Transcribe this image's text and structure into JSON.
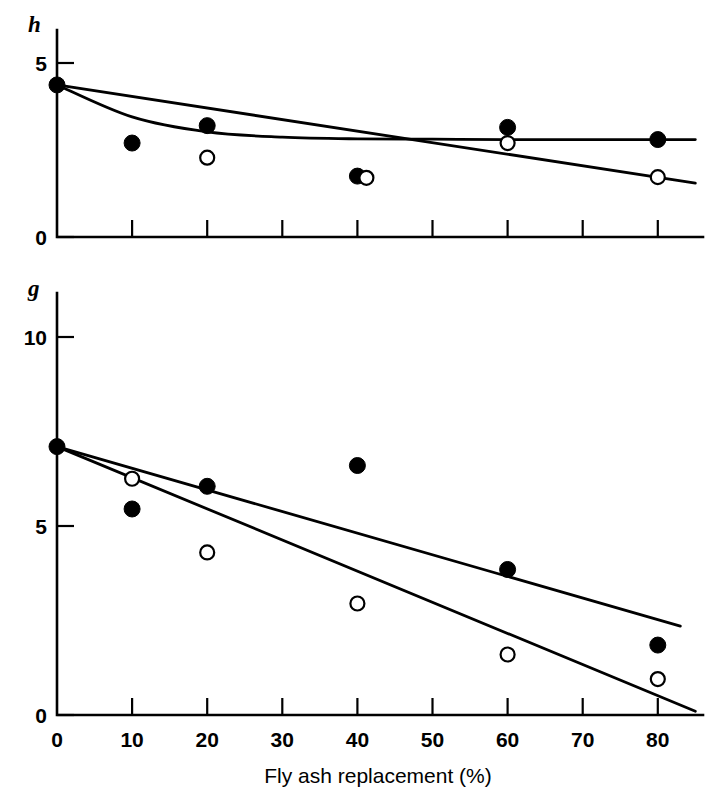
{
  "figure": {
    "background": "#ffffff",
    "ink": "#000000",
    "width": 725,
    "height": 802
  },
  "chart_data": [
    {
      "type": "scatter",
      "panel": "top",
      "title": "",
      "ylabel": "h",
      "xlabel": "",
      "xlim": [
        0,
        86
      ],
      "ylim": [
        0,
        5.6
      ],
      "xticks": [
        0,
        10,
        20,
        30,
        40,
        50,
        60,
        70,
        80
      ],
      "xticklabels": [
        "",
        "",
        "",
        "",
        "",
        "",
        "",
        "",
        ""
      ],
      "yticks": [
        0,
        5
      ],
      "yticklabels": [
        "0",
        "5"
      ],
      "grid": false,
      "legend": "none",
      "series": [
        {
          "name": "filled",
          "marker": "filled-circle",
          "x": [
            0,
            10,
            20,
            40,
            60,
            80
          ],
          "values": [
            4.37,
            2.7,
            3.2,
            1.75,
            3.15,
            2.8
          ]
        },
        {
          "name": "open",
          "marker": "open-circle",
          "x": [
            20,
            40,
            60,
            80
          ],
          "values": [
            2.28,
            1.7,
            2.7,
            1.72
          ]
        }
      ],
      "fits": [
        {
          "name": "filled-fit",
          "style": "curve",
          "x": [
            0,
            10,
            20,
            30,
            40,
            50,
            60,
            70,
            80,
            85
          ],
          "values": [
            4.37,
            3.45,
            3.02,
            2.87,
            2.82,
            2.81,
            2.8,
            2.8,
            2.8,
            2.8
          ]
        },
        {
          "name": "open-fit",
          "style": "line",
          "x": [
            0,
            85
          ],
          "values": [
            4.37,
            1.55
          ]
        }
      ]
    },
    {
      "type": "scatter",
      "panel": "bottom",
      "title": "",
      "ylabel": "g",
      "xlabel": "Fly ash replacement (%)",
      "xlim": [
        0,
        86
      ],
      "ylim": [
        0,
        11.5
      ],
      "xticks": [
        0,
        10,
        20,
        30,
        40,
        50,
        60,
        70,
        80
      ],
      "xticklabels": [
        "0",
        "10",
        "20",
        "30",
        "40",
        "50",
        "60",
        "70",
        "80"
      ],
      "yticks": [
        0,
        5,
        10
      ],
      "yticklabels": [
        "0",
        "5",
        "10"
      ],
      "grid": false,
      "legend": "none",
      "series": [
        {
          "name": "filled",
          "marker": "filled-circle",
          "x": [
            0,
            10,
            20,
            40,
            60,
            80
          ],
          "values": [
            7.1,
            5.45,
            6.05,
            6.6,
            3.85,
            1.85
          ]
        },
        {
          "name": "open",
          "marker": "open-circle",
          "x": [
            10,
            20,
            40,
            60,
            80
          ],
          "values": [
            6.25,
            4.3,
            2.95,
            1.6,
            0.95
          ]
        }
      ],
      "fits": [
        {
          "name": "filled-fit",
          "style": "line",
          "x": [
            0,
            83
          ],
          "values": [
            7.1,
            2.35
          ]
        },
        {
          "name": "open-fit",
          "style": "line",
          "x": [
            0,
            85
          ],
          "values": [
            7.1,
            0.1
          ]
        }
      ]
    }
  ]
}
